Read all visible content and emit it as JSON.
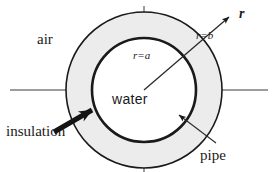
{
  "figure": {
    "type": "cross-section-diagram",
    "background_color": "#ffffff",
    "stroke_color": "#1a1a1a",
    "annulus_fill_color": "#ececec",
    "core_fill_color": "#ffffff"
  },
  "labels": {
    "air": "air",
    "insulation": "insulation",
    "water": "water",
    "pipe": "pipe",
    "radial_vector": "r",
    "outer_radius": "r=b",
    "inner_radius": "r=a"
  },
  "geometry": {
    "center_x": 144,
    "center_y": 90,
    "outer_radius_px": 78,
    "inner_radius_px": 52,
    "horizontal_axis_y": 90,
    "horizontal_axis_x1": 10,
    "horizontal_axis_x2": 268,
    "top_tick_y1": 7,
    "top_tick_y2": 16,
    "bottom_tick_y1": 165,
    "bottom_tick_y2": 172
  },
  "annotations": {
    "radial_arrow": {
      "name": "radial-vector-arrow",
      "from_x": 144,
      "from_y": 90,
      "to_x": 232,
      "to_y": 14
    },
    "insulation_arrow": {
      "name": "insulation-pointer-arrow",
      "from_x": 56,
      "from_y": 130,
      "to_x": 96,
      "to_y": 108
    },
    "pipe_arrow": {
      "name": "pipe-pointer-arrow",
      "from_x": 216,
      "from_y": 142,
      "to_x": 176,
      "to_y": 112
    }
  }
}
